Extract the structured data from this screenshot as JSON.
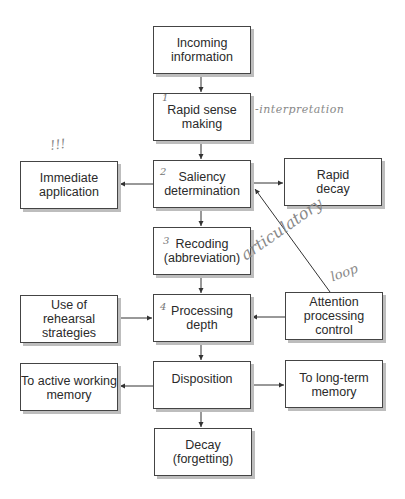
{
  "diagram": {
    "nodes": [
      {
        "id": "incoming",
        "label": "Incoming\ninformation"
      },
      {
        "id": "rapid_sense",
        "label": "Rapid sense\nmaking"
      },
      {
        "id": "immediate",
        "label": "Immediate\napplication"
      },
      {
        "id": "saliency",
        "label": "Saliency\ndetermination"
      },
      {
        "id": "rapid_decay",
        "label": "Rapid\ndecay"
      },
      {
        "id": "recoding",
        "label": "Recoding\n(abbreviation)"
      },
      {
        "id": "rehearsal",
        "label": "Use of\nrehearsal\nstrategies"
      },
      {
        "id": "processing",
        "label": "Processing\ndepth"
      },
      {
        "id": "attention",
        "label": "Attention\nprocessing\ncontrol"
      },
      {
        "id": "active_wm",
        "label": "To active working\nmemory"
      },
      {
        "id": "disposition",
        "label": "Disposition"
      },
      {
        "id": "long_term",
        "label": "To long-term\nmemory"
      },
      {
        "id": "decay",
        "label": "Decay\n(forgetting)"
      }
    ],
    "edges": [
      [
        "incoming",
        "rapid_sense"
      ],
      [
        "rapid_sense",
        "saliency"
      ],
      [
        "saliency",
        "immediate"
      ],
      [
        "saliency",
        "rapid_decay"
      ],
      [
        "saliency",
        "recoding"
      ],
      [
        "recoding",
        "processing"
      ],
      [
        "rehearsal",
        "processing"
      ],
      [
        "attention",
        "processing"
      ],
      [
        "attention",
        "saliency"
      ],
      [
        "processing",
        "disposition"
      ],
      [
        "disposition",
        "active_wm"
      ],
      [
        "disposition",
        "long_term"
      ],
      [
        "disposition",
        "decay"
      ]
    ],
    "annotations": {
      "interpretation": "-interpretation",
      "exclaim": "!!!",
      "articulatory": "articulatory",
      "loop": "loop",
      "n1": "1",
      "n2": "2",
      "n3": "3",
      "n4": "4"
    }
  }
}
